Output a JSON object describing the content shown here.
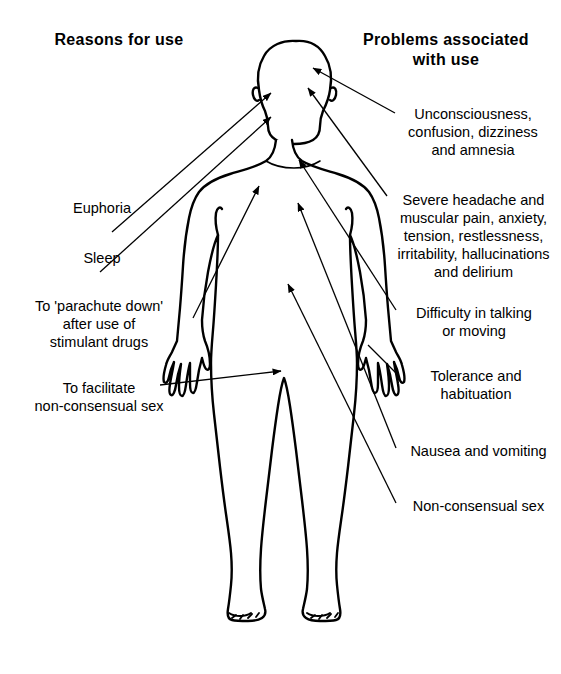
{
  "diagram": {
    "title_left": "Reasons for use",
    "title_right": "Problems associated\nwith use",
    "figure": {
      "name": "human-body-outline",
      "description": "Front-facing full-body human silhouette line drawing",
      "stroke_color": "#000000",
      "fill_color": "#ffffff"
    },
    "reasons_for_use": [
      {
        "id": "euphoria",
        "text": "Euphoria",
        "target": "head"
      },
      {
        "id": "sleep",
        "text": "Sleep",
        "target": "head"
      },
      {
        "id": "parachute",
        "text": "To 'parachute down'\nafter use of\nstimulant drugs",
        "target": "chest"
      },
      {
        "id": "facilitate",
        "text": "To facilitate\nnon-consensual sex",
        "target": "groin"
      }
    ],
    "problems_with_use": [
      {
        "id": "unconsciousness",
        "text": "Unconsciousness,\nconfusion, dizziness\nand amnesia",
        "target": "head"
      },
      {
        "id": "severe-headache",
        "text": "Severe headache and\nmuscular pain, anxiety,\ntension, restlessness,\nirritability, hallucinations\nand delirium",
        "target": "head"
      },
      {
        "id": "difficulty",
        "text": "Difficulty in talking\nor moving",
        "target": "neck"
      },
      {
        "id": "tolerance",
        "text": "Tolerance and\nhabituation",
        "target": "right-hand"
      },
      {
        "id": "nausea",
        "text": "Nausea and vomiting",
        "target": "abdomen"
      },
      {
        "id": "non-consensual",
        "text": "Non-consensual sex",
        "target": "groin"
      }
    ]
  }
}
